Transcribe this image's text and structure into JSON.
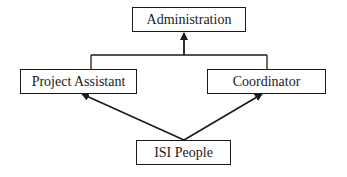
{
  "diagram": {
    "type": "org-hierarchy",
    "nodes": {
      "administration": {
        "label": "Administration"
      },
      "project_assistant": {
        "label": "Project Assistant"
      },
      "coordinator": {
        "label": "Coordinator"
      },
      "isi_people": {
        "label": "ISI People"
      }
    },
    "edges": [
      {
        "from": "project_assistant",
        "to": "administration",
        "style": "joined-bracket-arrow"
      },
      {
        "from": "coordinator",
        "to": "administration",
        "style": "joined-bracket-arrow"
      },
      {
        "from": "isi_people",
        "to": "project_assistant",
        "style": "arrow"
      },
      {
        "from": "isi_people",
        "to": "coordinator",
        "style": "arrow"
      }
    ],
    "colors": {
      "line": "#1a1a1a",
      "background": "#ffffff"
    }
  }
}
